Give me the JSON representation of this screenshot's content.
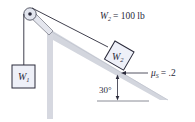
{
  "diagram": {
    "type": "physics-incline-pulley",
    "weight_label": {
      "symbol": "W",
      "subscript": "2",
      "equals": "= 100 lb"
    },
    "block1": {
      "symbol": "W",
      "subscript": "1"
    },
    "block2": {
      "symbol": "W",
      "subscript": "2"
    },
    "friction": {
      "symbol": "μ",
      "subscript": "S",
      "equals": "= .2"
    },
    "angle_label": "30°",
    "colors": {
      "line": "#2a2a3a",
      "block_fill": "#eef0f8",
      "incline_fill": "#d6d8e0",
      "incline_edge": "#c3c6d0",
      "pulley": "#dfe2ea"
    }
  }
}
